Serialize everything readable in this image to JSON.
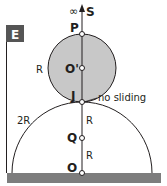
{
  "panel_label": "E",
  "labels": {
    "infinity": "∞",
    "s": "S",
    "p": "P",
    "o_prime": "O'",
    "j": "J",
    "q": "Q",
    "o": "O",
    "r_small_circle": "R",
    "r_upper_segment": "R",
    "r_lower_segment": "R",
    "two_r": "2R",
    "no_sliding": "no sliding"
  },
  "colors": {
    "small_circle_fill": "#c8c8c8",
    "ground_fill": "#7d7d7d",
    "line": "#231f20",
    "panel_label_bg": "#555555"
  }
}
